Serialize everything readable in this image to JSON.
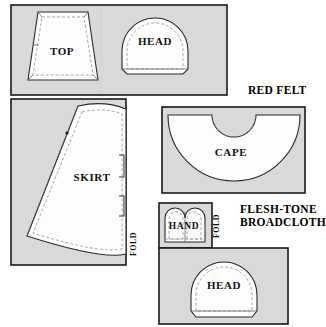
{
  "diagram": {
    "width": 326,
    "height": 327,
    "background_color": "#ffffff",
    "fabric_fill_color": "#d9d9d9",
    "piece_fill_color": "#fdfdfd",
    "outline_color": "#1a1a1a",
    "seam_line_color": "#8a8a8a"
  },
  "fabrics": [
    {
      "id": "main-fabric",
      "name_label": "",
      "panels": [
        "top-head-panel",
        "skirt-panel"
      ],
      "pieces": [
        "TOP",
        "HEAD",
        "SKIRT"
      ]
    },
    {
      "id": "red-felt",
      "name_label": "RED FELT",
      "panels": [
        "cape-panel"
      ],
      "pieces": [
        "CAPE"
      ]
    },
    {
      "id": "flesh-tone-broadcloth",
      "name_label_line1": "FLESH-TONE",
      "name_label_line2": "BROADCLOTH",
      "panels": [
        "hand-panel",
        "head-panel"
      ],
      "pieces": [
        "HAND",
        "HEAD"
      ]
    }
  ],
  "pieces": [
    {
      "id": "top",
      "label": "TOP",
      "shape": "trapezoid",
      "fabric": "main-fabric",
      "label_x": 62,
      "label_y": 51
    },
    {
      "id": "head-main",
      "label": "HEAD",
      "shape": "dome",
      "fabric": "main-fabric",
      "label_x": 155,
      "label_y": 41
    },
    {
      "id": "skirt",
      "label": "SKIRT",
      "shape": "flared-quadrilateral",
      "fabric": "main-fabric",
      "label_x": 92,
      "label_y": 177
    },
    {
      "id": "cape",
      "label": "CAPE",
      "shape": "semicircle-with-neck-cutout",
      "fabric": "red-felt",
      "label_x": 231,
      "label_y": 152
    },
    {
      "id": "hand",
      "label": "HAND",
      "shape": "double-mitten",
      "fabric": "flesh-tone-broadcloth",
      "label_x": 184,
      "label_y": 226
    },
    {
      "id": "head-flesh",
      "label": "HEAD",
      "shape": "dome",
      "fabric": "flesh-tone-broadcloth",
      "label_x": 224,
      "label_y": 285
    }
  ],
  "fold_markers": [
    {
      "id": "skirt-fold",
      "label": "FOLD",
      "orientation": "vertical",
      "x": 133,
      "y": 244
    },
    {
      "id": "hand-fold",
      "label": "FOLD",
      "orientation": "vertical",
      "x": 216,
      "y": 226
    }
  ],
  "fabric_labels": [
    {
      "id": "red-felt-label",
      "text": "RED FELT",
      "x": 248,
      "y": 91
    },
    {
      "id": "flesh-tone-label-line1",
      "text": "FLESH-TONE",
      "x": 240,
      "y": 210
    },
    {
      "id": "flesh-tone-label-line2",
      "text": "BROADCLOTH",
      "x": 240,
      "y": 223
    }
  ]
}
